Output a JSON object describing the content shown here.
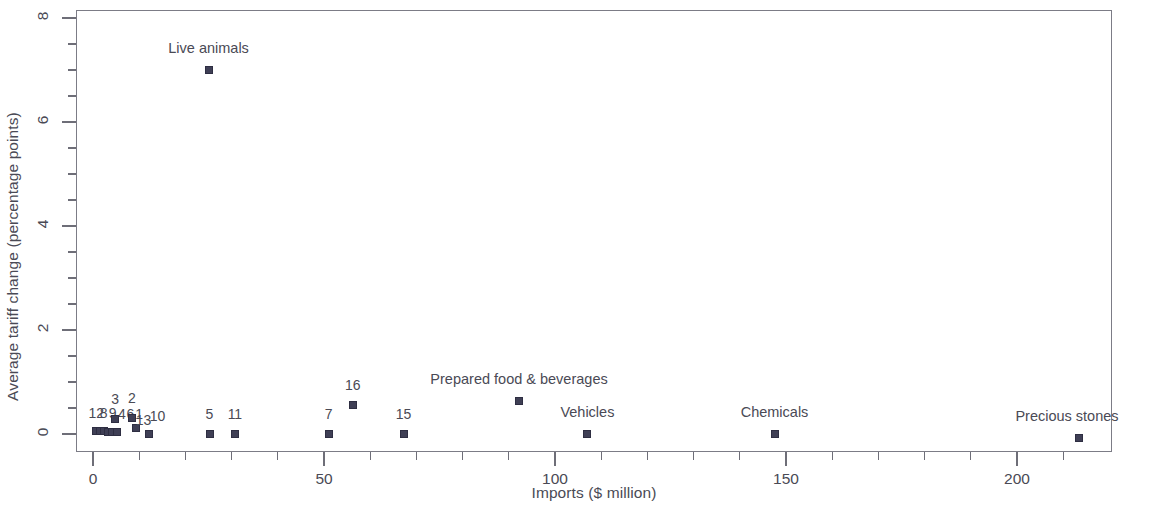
{
  "chart_data": {
    "type": "scatter",
    "title": "",
    "xlabel": "Imports ($ million)",
    "ylabel": "Average tariff change (percentage points)",
    "xlim": [
      -4,
      220
    ],
    "ylim": [
      -0.35,
      8.15
    ],
    "xticks": [
      0,
      50,
      100,
      150,
      200
    ],
    "xtick_labels": [
      "0",
      "50",
      "100",
      "150",
      "200"
    ],
    "yticks": [
      0,
      2,
      4,
      6,
      8
    ],
    "ytick_labels": [
      "0",
      "2",
      "4",
      "6",
      "8"
    ],
    "x_minor_step": 10,
    "y_minor_step": 0.5,
    "grid": false,
    "legend": "none",
    "marker_color": "#3f3f55",
    "axis_color": "#7c7c86",
    "text_color": "#4a4a55",
    "points": [
      {
        "label": "12",
        "x": 0.5,
        "y": 0.07,
        "lx": 0,
        "ly": -18
      },
      {
        "label": "8",
        "x": 1.2,
        "y": 0.07,
        "lx": 4,
        "ly": -18
      },
      {
        "label": "9",
        "x": 2.1,
        "y": 0.07,
        "lx": 9,
        "ly": -18
      },
      {
        "label": "4",
        "x": 3.0,
        "y": 0.05,
        "lx": 14,
        "ly": -18
      },
      {
        "label": "6",
        "x": 4.0,
        "y": 0.05,
        "lx": 18,
        "ly": -18
      },
      {
        "label": "1",
        "x": 5.0,
        "y": 0.05,
        "lx": 22,
        "ly": -18
      },
      {
        "label": "3",
        "x": 4.6,
        "y": 0.3,
        "lx": 0,
        "ly": -20
      },
      {
        "label": "2",
        "x": 8.2,
        "y": 0.33,
        "lx": 0,
        "ly": -20
      },
      {
        "label": "13",
        "x": 9.0,
        "y": 0.14,
        "lx": 8,
        "ly": -8
      },
      {
        "label": "10",
        "x": 12.0,
        "y": 0.02,
        "lx": 8,
        "ly": -18
      },
      {
        "label": "5",
        "x": 25.0,
        "y": 0.02,
        "lx": 0,
        "ly": -20
      },
      {
        "label": "11",
        "x": 30.5,
        "y": 0.02,
        "lx": 0,
        "ly": -20
      },
      {
        "label": "7",
        "x": 50.8,
        "y": 0.02,
        "lx": 0,
        "ly": -20
      },
      {
        "label": "16",
        "x": 56.0,
        "y": 0.57,
        "lx": 0,
        "ly": -20
      },
      {
        "label": "15",
        "x": 67.0,
        "y": 0.02,
        "lx": 0,
        "ly": -20
      },
      {
        "label": "Live animals",
        "x": 24.8,
        "y": 7.02,
        "lx": 0,
        "ly": -22
      },
      {
        "label": "Prepared food & beverages",
        "x": 92.0,
        "y": 0.66,
        "lx": 0,
        "ly": -22
      },
      {
        "label": "Vehicles",
        "x": 106.8,
        "y": 0.02,
        "lx": 0,
        "ly": -22
      },
      {
        "label": "Chemicals",
        "x": 147.3,
        "y": 0.02,
        "lx": 0,
        "ly": -22
      },
      {
        "label": "Precious stones",
        "x": 213.2,
        "y": -0.06,
        "lx": -12,
        "ly": -22
      }
    ]
  }
}
